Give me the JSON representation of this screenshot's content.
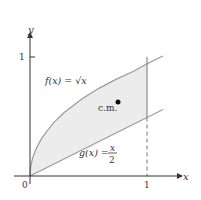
{
  "axes": {
    "x_label": "x",
    "y_label": "y",
    "origin_label": "0",
    "x_tick": "1",
    "y_tick": "1"
  },
  "curves": {
    "f_label": "f(x) = √x",
    "g_label_left": "g(x) = ",
    "g_num": "x",
    "g_den": "2"
  },
  "center_of_mass": {
    "label": "c.m."
  },
  "colors": {
    "curve": "#9a9a9a",
    "fill": "#ececec",
    "axis": "#333333"
  }
}
